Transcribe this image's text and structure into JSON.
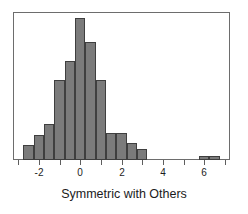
{
  "chart_data": {
    "type": "bar",
    "title": "",
    "subtitle": "",
    "xlabel": "Symmetric with Others",
    "ylabel": "",
    "xlim": [
      -3.25,
      7.25
    ],
    "ylim": [
      0,
      78
    ],
    "bin_width": 0.5,
    "grid": false,
    "legend": null,
    "annotations": [],
    "x_ticks": [
      -3,
      -2,
      -1,
      0,
      1,
      2,
      3,
      4,
      5,
      6,
      7
    ],
    "x_tick_labels": [
      "",
      "-2",
      "",
      "0",
      "",
      "2",
      "",
      "4",
      "",
      "6",
      ""
    ],
    "y_ticks": [],
    "y_tick_labels": [],
    "bar_fill": "#7b7b7b",
    "bar_edge": "#3f3f3f",
    "frame_color": "#6d6d6d",
    "bins": [
      {
        "x0": -2.75,
        "x1": -2.25,
        "value": 8
      },
      {
        "x0": -2.25,
        "x1": -1.75,
        "value": 13
      },
      {
        "x0": -1.75,
        "x1": -1.25,
        "value": 19
      },
      {
        "x0": -1.25,
        "x1": -0.75,
        "value": 42
      },
      {
        "x0": -0.75,
        "x1": -0.25,
        "value": 52
      },
      {
        "x0": -0.25,
        "x1": 0.25,
        "value": 75
      },
      {
        "x0": 0.25,
        "x1": 0.75,
        "value": 62
      },
      {
        "x0": 0.75,
        "x1": 1.25,
        "value": 42
      },
      {
        "x0": 1.25,
        "x1": 1.75,
        "value": 14
      },
      {
        "x0": 1.75,
        "x1": 2.25,
        "value": 14
      },
      {
        "x0": 2.25,
        "x1": 2.75,
        "value": 9
      },
      {
        "x0": 2.75,
        "x1": 3.25,
        "value": 6
      },
      {
        "x0": 5.75,
        "x1": 6.25,
        "value": 2
      },
      {
        "x0": 6.25,
        "x1": 6.75,
        "value": 2
      }
    ],
    "categories": [
      "-2.5",
      "-2.0",
      "-1.5",
      "-1.0",
      "-0.5",
      "0.0",
      "0.5",
      "1.0",
      "1.5",
      "2.0",
      "2.5",
      "3.0",
      "6.0",
      "6.5"
    ],
    "values": [
      8,
      13,
      19,
      42,
      52,
      75,
      62,
      42,
      14,
      14,
      9,
      6,
      2,
      2
    ]
  },
  "axis": {
    "label": "Symmetric with Others"
  }
}
